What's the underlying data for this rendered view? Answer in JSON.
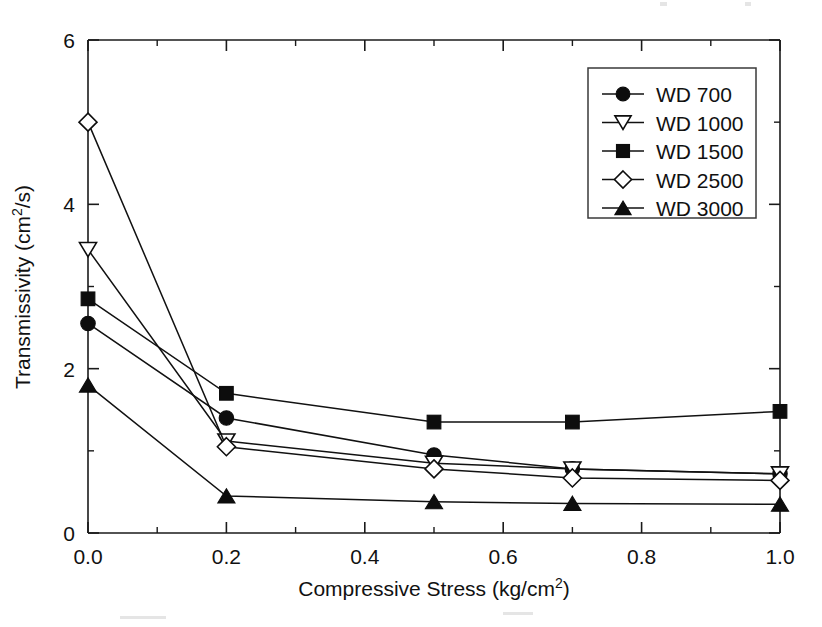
{
  "figure": {
    "background": "#ffffff",
    "ink_color": "#111111"
  },
  "chart_data": {
    "type": "line",
    "title": "",
    "xlabel": "Compressive Stress (kg/cm2)",
    "xlabel_base": "Compressive Stress (kg/cm",
    "xlabel_sup": "2",
    "xlabel_tail": ")",
    "ylabel": "Transmissivity (cm2/s)",
    "ylabel_base": "Transmissivity (cm",
    "ylabel_sup": "2",
    "ylabel_tail": "/s)",
    "xlim": [
      0.0,
      1.0
    ],
    "ylim": [
      0,
      6
    ],
    "grid": false,
    "legend_position": "top-right",
    "x_ticks": [
      0.0,
      0.2,
      0.4,
      0.6,
      0.8,
      1.0
    ],
    "x_tick_labels": [
      "0.0",
      "0.2",
      "0.4",
      "0.6",
      "0.8",
      "1.0"
    ],
    "x_minor_ticks": [
      0.1,
      0.3,
      0.5,
      0.7,
      0.9
    ],
    "y_ticks": [
      0,
      2,
      4,
      6
    ],
    "y_tick_labels": [
      "0",
      "2",
      "4",
      "6"
    ],
    "y_minor_ticks": [
      1,
      3,
      5
    ],
    "x": [
      0.0,
      0.2,
      0.5,
      0.7,
      1.0
    ],
    "series": [
      {
        "name": "WD 700",
        "marker": "circle-filled",
        "values": [
          2.55,
          1.4,
          0.95,
          0.78,
          0.72
        ]
      },
      {
        "name": "WD 1000",
        "marker": "triangle-down-open",
        "values": [
          3.45,
          1.12,
          0.85,
          0.78,
          0.72
        ]
      },
      {
        "name": "WD 1500",
        "marker": "square-filled",
        "values": [
          2.85,
          1.7,
          1.35,
          1.35,
          1.48
        ]
      },
      {
        "name": "WD 2500",
        "marker": "diamond-open",
        "values": [
          5.0,
          1.05,
          0.78,
          0.67,
          0.64
        ]
      },
      {
        "name": "WD 3000",
        "marker": "triangle-up-filled",
        "values": [
          1.8,
          0.45,
          0.38,
          0.36,
          0.35
        ]
      }
    ]
  }
}
